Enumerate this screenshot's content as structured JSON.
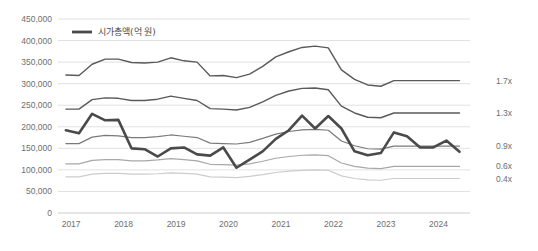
{
  "chart_data": {
    "type": "line",
    "title": "",
    "subtitle": "",
    "xlabel": "",
    "ylabel": "",
    "ylim": [
      0,
      450000
    ],
    "grid": true,
    "legend_position": "top-left",
    "y_ticks": [
      "0",
      "50,000",
      "100,000",
      "150,000",
      "200,000",
      "250,000",
      "300,000",
      "350,000",
      "400,000",
      "450,000"
    ],
    "y_tick_values": [
      0,
      50000,
      100000,
      150000,
      200000,
      250000,
      300000,
      350000,
      400000,
      450000
    ],
    "x_ticks": [
      "2017",
      "2018",
      "2019",
      "2020",
      "2021",
      "2022",
      "2023",
      "2024"
    ],
    "x_tick_values": [
      2017,
      2018,
      2019,
      2020,
      2021,
      2022,
      2023,
      2024
    ],
    "x": [
      2016.9,
      2017.15,
      2017.4,
      2017.65,
      2017.9,
      2018.15,
      2018.4,
      2018.65,
      2018.9,
      2019.15,
      2019.4,
      2019.65,
      2019.9,
      2020.15,
      2020.4,
      2020.65,
      2020.9,
      2021.15,
      2021.4,
      2021.65,
      2021.9,
      2022.15,
      2022.4,
      2022.65,
      2022.9,
      2023.15,
      2023.4,
      2023.65,
      2023.9,
      2024.15,
      2024.4
    ],
    "legend": [
      {
        "label": "시가총액(억 원)",
        "color": "#4a4a4a",
        "width": 2.6
      }
    ],
    "right_labels": [
      "1.7x",
      "1.3x",
      "0.9x",
      "0.6x",
      "0.4x"
    ],
    "series": [
      {
        "name": "1.7x",
        "right_label": "1.7x",
        "color": "#5a5a5a",
        "width": 1.4,
        "values": [
          320000,
          319000,
          345000,
          357000,
          357000,
          349000,
          348000,
          350000,
          360000,
          353000,
          350000,
          318000,
          319000,
          314000,
          322000,
          340000,
          362000,
          374000,
          384000,
          387000,
          383000,
          332000,
          310000,
          297000,
          294000,
          307000,
          307000,
          307000,
          307000,
          307000,
          307000
        ]
      },
      {
        "name": "1.3x",
        "right_label": "1.3x",
        "color": "#5a5a5a",
        "width": 1.4,
        "values": [
          241000,
          241000,
          263000,
          267000,
          266000,
          261000,
          261000,
          264000,
          271000,
          266000,
          261000,
          242000,
          241000,
          239000,
          245000,
          258000,
          273000,
          283000,
          289000,
          290000,
          286000,
          248000,
          232000,
          222000,
          221000,
          232000,
          232000,
          232000,
          232000,
          232000,
          232000
        ]
      },
      {
        "name": "0.9x",
        "right_label": "0.9x",
        "color": "#7a7a7a",
        "width": 1.2,
        "values": [
          161000,
          161000,
          176000,
          180000,
          179000,
          175000,
          175000,
          177000,
          181000,
          178000,
          175000,
          162000,
          161000,
          160000,
          164000,
          173000,
          183000,
          189000,
          193000,
          194000,
          192000,
          167000,
          156000,
          149000,
          148000,
          155000,
          155000,
          155000,
          155000,
          155000,
          155000
        ]
      },
      {
        "name": "0.6x",
        "right_label": "0.6x",
        "color": "#a8a8a8",
        "width": 1.2,
        "values": [
          114000,
          114000,
          122000,
          124000,
          124000,
          121000,
          121000,
          123000,
          126000,
          124000,
          121000,
          113000,
          112000,
          111000,
          114000,
          120000,
          127000,
          131000,
          134000,
          135000,
          133000,
          116000,
          108000,
          104000,
          103000,
          108000,
          108000,
          108000,
          108000,
          108000,
          108000
        ]
      },
      {
        "name": "0.4x",
        "right_label": "0.4x",
        "color": "#cccccc",
        "width": 1.2,
        "values": [
          84000,
          84000,
          90000,
          92000,
          92000,
          90000,
          90000,
          91000,
          93000,
          92000,
          90000,
          84000,
          83000,
          82000,
          85000,
          89000,
          94000,
          97000,
          99000,
          100000,
          99000,
          86000,
          80000,
          77000,
          76000,
          80000,
          80000,
          80000,
          80000,
          80000,
          80000
        ]
      },
      {
        "name": "시가총액(억 원)",
        "right_label": "",
        "color": "#4a4a4a",
        "width": 2.6,
        "values": [
          192000,
          185000,
          230000,
          215000,
          216000,
          150000,
          148000,
          131000,
          150000,
          152000,
          136000,
          133000,
          152000,
          105000,
          124000,
          143000,
          172000,
          192000,
          226000,
          196000,
          225000,
          196000,
          143000,
          134000,
          139000,
          187000,
          178000,
          152000,
          152000,
          168000,
          142000
        ]
      }
    ]
  },
  "chart_meta": {
    "plot_left": 58,
    "plot_right": 470,
    "plot_top": 19,
    "plot_bottom": 213,
    "x_min": 2016.75,
    "x_max": 2024.6,
    "grid_color": "#d9d9d9",
    "axis_color": "#c8c8c8",
    "background": "#ffffff",
    "tick_label_color": "#6e6e6e"
  }
}
